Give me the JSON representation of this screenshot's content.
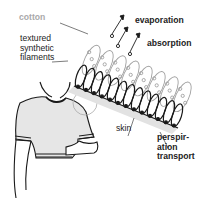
{
  "labels": {
    "cotton": "cotton",
    "filaments": "textured\nsynthetic\nfilaments",
    "evaporation": "evaporation",
    "absorption": "absorption",
    "skin": "skin",
    "perspiration": "perspir-\nation\ntransport"
  },
  "colors": {
    "line": "#1a1a1a",
    "cotton_line": "#a0a0a0",
    "label": "#222222",
    "cotton_label": "#a9a9a9",
    "shirt_fill": "#e6e6e6",
    "skin_band": "#e2e2e2"
  },
  "icons": {
    "evaporation_arrows": "arrow-up-right",
    "moisture_droplets": "small-circle"
  }
}
